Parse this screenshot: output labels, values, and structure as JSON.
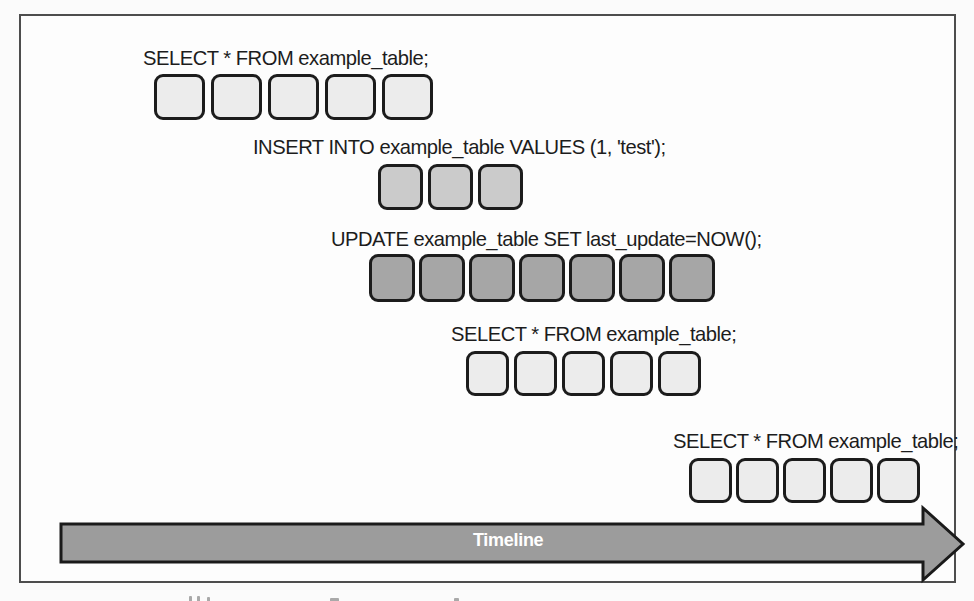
{
  "figure": {
    "queries": [
      {
        "sql": "SELECT * FROM example_table;",
        "block_count": 5,
        "shade": "#ececec"
      },
      {
        "sql": "INSERT INTO example_table VALUES (1, 'test');",
        "block_count": 3,
        "shade": "#cbcbcb"
      },
      {
        "sql": "UPDATE example_table SET last_update=NOW();",
        "block_count": 7,
        "shade": "#a6a6a6"
      },
      {
        "sql": "SELECT * FROM example_table;",
        "block_count": 5,
        "shade": "#ececec"
      },
      {
        "sql": "SELECT * FROM example_table;",
        "block_count": 5,
        "shade": "#ececec"
      }
    ],
    "timeline": {
      "label": "Timeline",
      "fill": "#9c9c9c",
      "border": "#1a1a1a",
      "text_color": "#ffffff"
    },
    "colors": {
      "block_border": "#1c1c1c",
      "frame_border": "#4d4d4d",
      "text": "#1c1c1c",
      "background": "#fdfdfd"
    }
  }
}
